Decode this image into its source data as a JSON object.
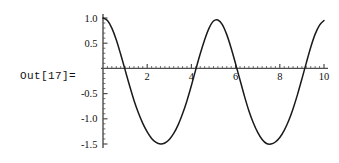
{
  "cell": {
    "out_label": "Out[17]=",
    "label_color": "#111111"
  },
  "chart_data": {
    "type": "line",
    "title": "",
    "subtitle": "",
    "xlabel": "",
    "ylabel": "",
    "grid": false,
    "legend": false,
    "legend_position": "none",
    "line_color": "#1a1a1a",
    "axis_color": "#4d4d4d",
    "xlim": [
      0,
      10
    ],
    "ylim": [
      -1.5,
      1.0
    ],
    "xticks": [
      2,
      4,
      6,
      8,
      10
    ],
    "xtick_labels": [
      "2",
      "4",
      "6",
      "8",
      "10"
    ],
    "yticks": [
      1.0,
      0.5,
      -0.5,
      -1.0,
      -1.5
    ],
    "ytick_labels": [
      "1.0",
      "0.5",
      "-0.5",
      "-1.0",
      "-1.5"
    ],
    "x": [
      0.0,
      0.2,
      0.4,
      0.6,
      0.8,
      1.0,
      1.2,
      1.4,
      1.6,
      1.8,
      2.0,
      2.2,
      2.4,
      2.6,
      2.8,
      3.0,
      3.2,
      3.4,
      3.6,
      3.8,
      4.0,
      4.2,
      4.4,
      4.6,
      4.8,
      5.0,
      5.2,
      5.4,
      5.6,
      5.8,
      6.0,
      6.2,
      6.4,
      6.6,
      6.8,
      7.0,
      7.2,
      7.4,
      7.6,
      7.8,
      8.0,
      8.2,
      8.4,
      8.6,
      8.8,
      9.0,
      9.2,
      9.4,
      9.6,
      9.8,
      10.0
    ],
    "y": [
      1.0,
      0.95,
      0.8,
      0.57,
      0.28,
      -0.03,
      -0.34,
      -0.63,
      -0.88,
      -1.09,
      -1.26,
      -1.39,
      -1.47,
      -1.5,
      -1.48,
      -1.41,
      -1.29,
      -1.12,
      -0.9,
      -0.64,
      -0.34,
      -0.02,
      0.29,
      0.57,
      0.8,
      0.94,
      0.96,
      0.87,
      0.67,
      0.4,
      0.09,
      -0.23,
      -0.55,
      -0.84,
      -1.08,
      -1.27,
      -1.41,
      -1.49,
      -1.5,
      -1.46,
      -1.37,
      -1.23,
      -1.04,
      -0.8,
      -0.52,
      -0.21,
      0.11,
      0.42,
      0.68,
      0.86,
      0.95
    ],
    "series": [
      {
        "name": "curve",
        "values": [
          1.0,
          0.95,
          0.8,
          0.57,
          0.28,
          -0.03,
          -0.34,
          -0.63,
          -0.88,
          -1.09,
          -1.26,
          -1.39,
          -1.47,
          -1.5,
          -1.48,
          -1.41,
          -1.29,
          -1.12,
          -0.9,
          -0.64,
          -0.34,
          -0.02,
          0.29,
          0.57,
          0.8,
          0.94,
          0.96,
          0.87,
          0.67,
          0.4,
          0.09,
          -0.23,
          -0.55,
          -0.84,
          -1.08,
          -1.27,
          -1.41,
          -1.49,
          -1.5,
          -1.46,
          -1.37,
          -1.23,
          -1.04,
          -0.8,
          -0.52,
          -0.21,
          0.11,
          0.42,
          0.68,
          0.86,
          0.95
        ]
      }
    ],
    "annotations": []
  }
}
